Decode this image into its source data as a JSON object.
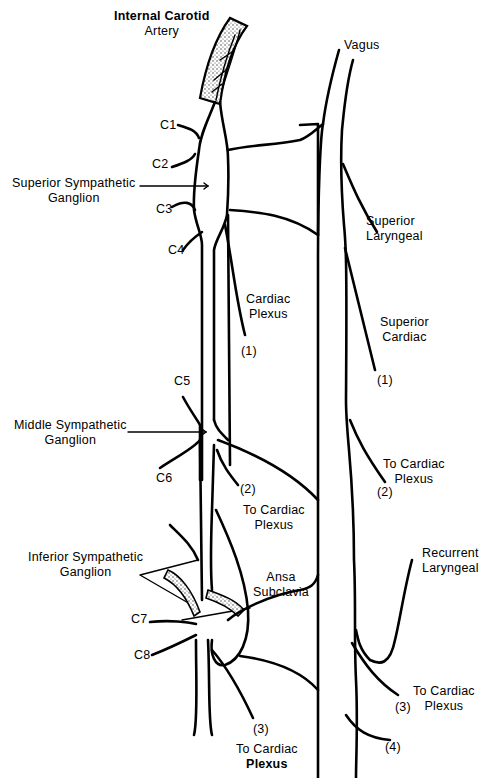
{
  "diagram": {
    "labels": {
      "internal_carotid_line1": "Internal Carotid",
      "internal_carotid_line2": "Artery",
      "vagus": "Vagus",
      "c1": "C1",
      "c2": "C2",
      "c3": "C3",
      "c4": "C4",
      "c5": "C5",
      "c6": "C6",
      "c7": "C7",
      "c8": "C8",
      "superior_ganglion_line1": "Superior Sympathetic",
      "superior_ganglion_line2": "Ganglion",
      "middle_ganglion_line1": "Middle Sympathetic",
      "middle_ganglion_line2": "Ganglion",
      "inferior_ganglion_line1": "Inferior Sympathetic",
      "inferior_ganglion_line2": "Ganglion",
      "superior_laryngeal_line1": "Superior",
      "superior_laryngeal_line2": "Laryngeal",
      "cardiac_plexus_line1": "Cardiac",
      "cardiac_plexus_line2": "Plexus",
      "symp_branch_1": "(1)",
      "superior_cardiac_line1": "Superior",
      "superior_cardiac_line2": "Cardiac",
      "vagal_branch_1": "(1)",
      "symp_branch_2": "(2)",
      "to_cardiac_plexus_mid_line1": "To Cardiac",
      "to_cardiac_plexus_mid_line2": "Plexus",
      "vagal_to_cardiac_2_line1": "To Cardiac",
      "vagal_to_cardiac_2_line2": "Plexus",
      "vagal_branch_2": "(2)",
      "recurrent_laryngeal_line1": "Recurrent",
      "recurrent_laryngeal_line2": "Laryngeal",
      "ansa_subclavia_line1": "Ansa",
      "ansa_subclavia_line2": "Subclavia",
      "vagal_branch_3": "(3)",
      "vagal_to_cardiac_3_line1": "To Cardiac",
      "vagal_to_cardiac_3_line2": "Plexus",
      "vagal_branch_4": "(4)",
      "symp_branch_3": "(3)",
      "symp_to_cardiac_3_line1": "To Cardiac",
      "symp_to_cardiac_3_line2": "Plexus"
    },
    "colors": {
      "line": "#000000",
      "background": "#ffffff",
      "artery_fill": "#d9d9d9"
    }
  }
}
